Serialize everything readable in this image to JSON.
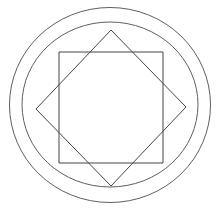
{
  "figure": {
    "type": "geometric-line-diagram",
    "canvas": {
      "width": 220,
      "height": 219,
      "background_color": "#ffffff"
    },
    "center": {
      "x": 110.5,
      "y": 106.0
    },
    "stroke": {
      "color": "#5a5a5a",
      "dark_color": "#3c3c3c",
      "width": 1,
      "style": "solid-thin-handdrawn"
    },
    "shapes": [
      {
        "name": "outer-circle",
        "kind": "ellipse",
        "cx": 110.0,
        "cy": 105.0,
        "rx": 100.5,
        "ry": 97.5,
        "stroke_color": "#5f5f5f",
        "stroke_width": 1,
        "bounds": {
          "left": 9,
          "top": 7,
          "right": 210,
          "bottom": 202
        }
      },
      {
        "name": "inner-circle",
        "kind": "ellipse",
        "cx": 110.0,
        "cy": 104.5,
        "rx": 88.0,
        "ry": 82.5,
        "stroke_color": "#5f5f5f",
        "stroke_width": 1,
        "bounds": {
          "left": 22,
          "top": 22,
          "right": 198,
          "bottom": 187
        }
      },
      {
        "name": "upright-square",
        "kind": "polygon",
        "rotation_deg": 0,
        "stroke_color": "#454545",
        "stroke_width": 1,
        "points": [
          {
            "x": 59,
            "y": 52
          },
          {
            "x": 163,
            "y": 52
          },
          {
            "x": 163,
            "y": 163
          },
          {
            "x": 59,
            "y": 163
          }
        ]
      },
      {
        "name": "rotated-square",
        "kind": "polygon",
        "rotation_deg": 45,
        "stroke_color": "#454545",
        "stroke_width": 1,
        "points": [
          {
            "x": 111,
            "y": 30
          },
          {
            "x": 186,
            "y": 107
          },
          {
            "x": 111,
            "y": 186
          },
          {
            "x": 36,
            "y": 109
          }
        ]
      }
    ],
    "star_points": 8,
    "labels": [],
    "annotations": []
  }
}
